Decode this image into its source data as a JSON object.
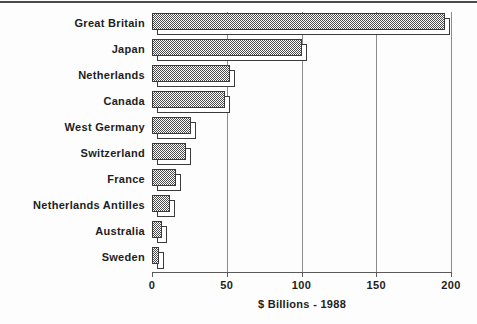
{
  "chart_data": {
    "type": "bar",
    "orientation": "horizontal",
    "title": "",
    "xlabel": "$ Billions - 1988",
    "ylabel": "",
    "xlim": [
      0,
      200
    ],
    "xticks": [
      "0",
      "50",
      "100",
      "150",
      "200"
    ],
    "grid": true,
    "legend": false,
    "categories": [
      "Great Britain",
      "Japan",
      "Netherlands",
      "Canada",
      "West Germany",
      "Switzerland",
      "France",
      "Netherlands Antilles",
      "Australia",
      "Sweden"
    ],
    "values": [
      196,
      100,
      52,
      49,
      26,
      23,
      16,
      12,
      7,
      5
    ],
    "colors": {
      "bar_fill": "#4c4c4c",
      "bar_edge": "#3a3a3a",
      "shadow_fill": "#ffffff",
      "gridline": "#8c8c8c",
      "axis": "#5a5a5a",
      "text": "#1d1d1d",
      "background": "#fdfdfd",
      "top_rule": "#4a4a4a"
    }
  }
}
